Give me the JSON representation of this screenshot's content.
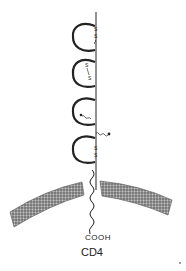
{
  "diagram": {
    "molecule_label": "CD4",
    "terminus_label": "COOH",
    "disulfide_label": "S",
    "domains": 4,
    "colors": {
      "line": "#222222",
      "membrane": "#6a6a6a",
      "background": "#ffffff"
    }
  }
}
